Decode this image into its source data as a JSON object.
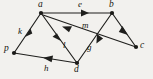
{
  "figure": {
    "kind": "directed-graph",
    "background_color": "#f2f1ee",
    "ink_color": "#1f1f1d",
    "width": 153,
    "height": 79
  },
  "nodes": [
    {
      "id": "a",
      "label": "a",
      "x": 41,
      "y": 13,
      "label_x": 38,
      "label_y": 1
    },
    {
      "id": "b",
      "label": "b",
      "x": 112,
      "y": 13,
      "label_x": 109,
      "label_y": 1
    },
    {
      "id": "c",
      "label": "c",
      "x": 136,
      "y": 47,
      "label_x": 140,
      "label_y": 41
    },
    {
      "id": "d",
      "label": "d",
      "x": 77,
      "y": 63,
      "label_x": 74,
      "label_y": 65
    },
    {
      "id": "p",
      "label": "p",
      "x": 14,
      "y": 53,
      "label_x": 5,
      "label_y": 45
    }
  ],
  "edges": [
    {
      "id": "e",
      "label": "e",
      "from": "a",
      "to": "b",
      "label_x": 78,
      "label_y": 1
    },
    {
      "id": "k",
      "label": "k",
      "from": "p",
      "to": "a",
      "label_x": 19,
      "label_y": 28
    },
    {
      "id": "l",
      "label": "l",
      "from": "a",
      "to": "d",
      "label_x": 63,
      "label_y": 42
    },
    {
      "id": "m",
      "label": "m",
      "from": "c",
      "to": "a",
      "label_x": 83,
      "label_y": 22
    },
    {
      "id": "g",
      "label": "g",
      "from": "d",
      "to": "b",
      "label_x": 87,
      "label_y": 44
    },
    {
      "id": "h",
      "label": "h",
      "from": "d",
      "to": "p",
      "label_x": 44,
      "label_y": 64
    },
    {
      "id": "n1",
      "label": "",
      "from": "b",
      "to": "c",
      "label_x": 0,
      "label_y": 0
    }
  ],
  "edge_labels_visible": [
    "e",
    "k",
    "l",
    "m",
    "g",
    "h"
  ],
  "node_labels_visible": [
    "a",
    "b",
    "c",
    "d",
    "p"
  ]
}
